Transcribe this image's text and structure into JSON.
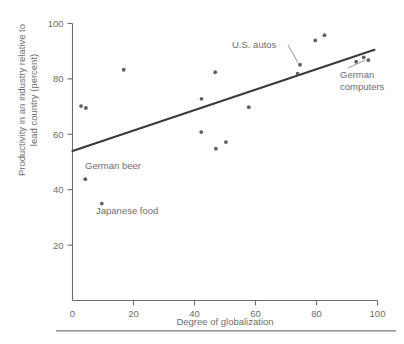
{
  "chart_data": {
    "type": "scatter",
    "title": "",
    "xlabel": "Degree of globalization",
    "ylabel": "Productivity in an industry relative to lead country (percent)",
    "xlim": [
      0,
      100
    ],
    "ylim": [
      0,
      100
    ],
    "xticks": [
      0,
      20,
      40,
      60,
      80,
      100
    ],
    "yticks": [
      20,
      40,
      60,
      80,
      100
    ],
    "xtick_labels": [
      "0",
      "20",
      "40",
      "60",
      "80",
      "100"
    ],
    "ytick_labels": [
      "20",
      "40",
      "60",
      "80",
      "100"
    ],
    "grid": false,
    "legend": "none",
    "points": [
      {
        "x": 2.8,
        "y": 70.2,
        "label": ""
      },
      {
        "x": 4.4,
        "y": 69.5,
        "label": ""
      },
      {
        "x": 4.2,
        "y": 43.8,
        "label": "German beer"
      },
      {
        "x": 9.6,
        "y": 35.0,
        "label": "Japanese food"
      },
      {
        "x": 16.8,
        "y": 83.3,
        "label": ""
      },
      {
        "x": 42.3,
        "y": 72.8,
        "label": ""
      },
      {
        "x": 42.2,
        "y": 60.8,
        "label": ""
      },
      {
        "x": 46.8,
        "y": 82.4,
        "label": ""
      },
      {
        "x": 47.0,
        "y": 54.8,
        "label": ""
      },
      {
        "x": 50.3,
        "y": 57.2,
        "label": ""
      },
      {
        "x": 57.8,
        "y": 69.8,
        "label": ""
      },
      {
        "x": 73.8,
        "y": 81.9,
        "label": ""
      },
      {
        "x": 74.6,
        "y": 85.1,
        "label": "U.S. autos"
      },
      {
        "x": 79.6,
        "y": 93.9,
        "label": ""
      },
      {
        "x": 82.6,
        "y": 95.8,
        "label": ""
      },
      {
        "x": 93.0,
        "y": 86.2,
        "label": ""
      },
      {
        "x": 95.5,
        "y": 87.8,
        "label": "German computers"
      },
      {
        "x": 97.0,
        "y": 86.8,
        "label": ""
      }
    ],
    "trend_line": {
      "x_start": 0,
      "y_start": 54.0,
      "x_end": 99.0,
      "y_end": 90.5
    },
    "annotations": [
      {
        "name": "us-autos",
        "text": "U.S. autos",
        "target_x": 74.6,
        "target_y": 85.1,
        "has_leader": true
      },
      {
        "name": "german-computers",
        "text_line1": "German",
        "text_line2": "computers",
        "target_x": 95.5,
        "target_y": 87.8,
        "has_leader": true
      },
      {
        "name": "german-beer",
        "text": "German beer",
        "target_x": 4.2,
        "target_y": 43.8,
        "has_leader": false
      },
      {
        "name": "japanese-food",
        "text": "Japanese food",
        "target_x": 9.6,
        "target_y": 35.0,
        "has_leader": false
      }
    ],
    "colors": {
      "point": "#5f5f5f",
      "trend": "#3b3b3b",
      "axis": "#6d6d6d",
      "text": "#6d6d6d",
      "background": "#ffffff"
    }
  }
}
